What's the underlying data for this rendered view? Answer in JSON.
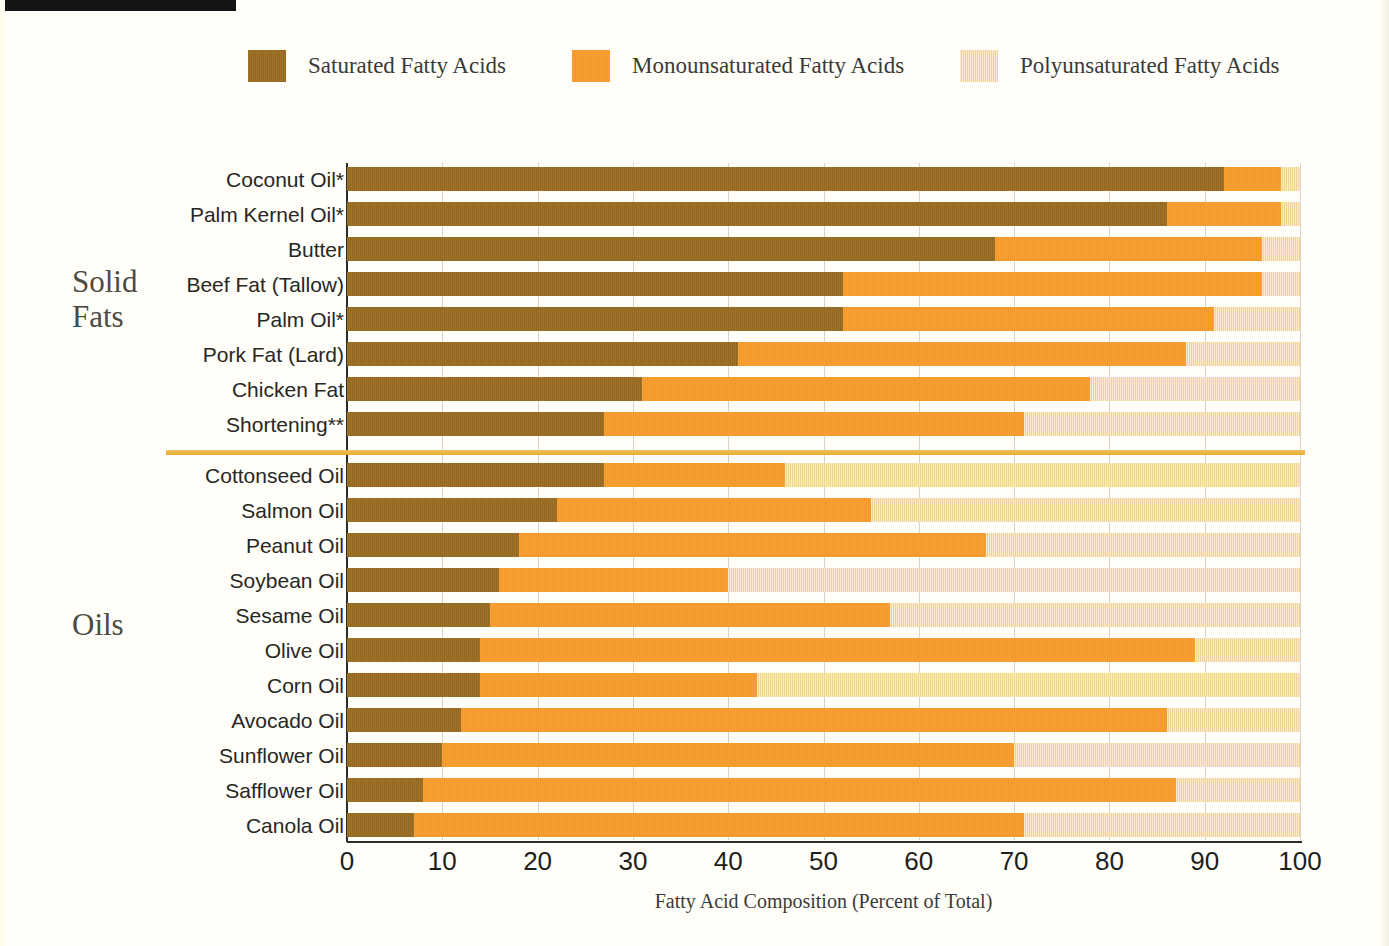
{
  "legend": {
    "items": [
      {
        "label": "Saturated Fatty Acids",
        "color": "#9A6B20",
        "icon": "legend-swatch-saturated"
      },
      {
        "label": "Monounsaturated Fatty Acids",
        "color": "#F89B2A",
        "icon": "legend-swatch-monounsaturated"
      },
      {
        "label": "Polyunsaturated Fatty Acids",
        "color": "#F9DCA8",
        "icon": "legend-swatch-polyunsaturated"
      }
    ]
  },
  "groups": {
    "solid_fats": "Solid\nFats",
    "solid_fats_line1": "Solid",
    "solid_fats_line2": "Fats",
    "oils": "Oils"
  },
  "chart_data": {
    "type": "bar",
    "orientation": "horizontal",
    "stacked": true,
    "title": "",
    "xlabel": "Fatty Acid Composition (Percent of Total)",
    "ylabel": "",
    "xlim": [
      0,
      100
    ],
    "xticks": [
      0,
      10,
      20,
      30,
      40,
      50,
      60,
      70,
      80,
      90,
      100
    ],
    "grid": true,
    "legend_position": "top",
    "categories": [
      "Coconut Oil*",
      "Palm Kernel Oil*",
      "Butter",
      "Beef Fat (Tallow)",
      "Palm Oil*",
      "Pork Fat (Lard)",
      "Chicken Fat",
      "Shortening**",
      "Cottonseed  Oil",
      "Salmon Oil",
      "Peanut Oil",
      "Soybean Oil",
      "Sesame Oil",
      "Olive Oil",
      "Corn Oil",
      "Avocado Oil",
      "Sunflower Oil",
      "Safflower Oil",
      "Canola Oil"
    ],
    "group_of_category": [
      "Solid Fats",
      "Solid Fats",
      "Solid Fats",
      "Solid Fats",
      "Solid Fats",
      "Solid Fats",
      "Solid Fats",
      "Solid Fats",
      "Oils",
      "Oils",
      "Oils",
      "Oils",
      "Oils",
      "Oils",
      "Oils",
      "Oils",
      "Oils",
      "Oils",
      "Oils"
    ],
    "series": [
      {
        "name": "Saturated Fatty Acids",
        "color": "#9A6B20",
        "values": [
          92,
          86,
          68,
          52,
          52,
          41,
          31,
          27,
          27,
          22,
          18,
          16,
          15,
          14,
          14,
          12,
          10,
          8,
          7
        ]
      },
      {
        "name": "Monounsaturated Fatty Acids",
        "color": "#F89B2A",
        "values": [
          6,
          12,
          28,
          44,
          39,
          47,
          47,
          44,
          19,
          33,
          49,
          24,
          42,
          75,
          29,
          74,
          60,
          79,
          64
        ]
      },
      {
        "name": "Polyunsaturated Fatty Acids",
        "color": "#F9DCA8",
        "values": [
          2,
          2,
          4,
          4,
          9,
          12,
          22,
          29,
          54,
          45,
          33,
          60,
          43,
          11,
          57,
          14,
          30,
          13,
          29
        ]
      }
    ],
    "cumulative_endpoints": {
      "saturated_end": [
        92,
        86,
        68,
        52,
        52,
        41,
        31,
        27,
        27,
        22,
        18,
        16,
        15,
        14,
        14,
        12,
        10,
        8,
        7
      ],
      "mono_end": [
        98,
        98,
        96,
        96,
        91,
        88,
        78,
        71,
        46,
        55,
        67,
        40,
        57,
        89,
        43,
        86,
        70,
        87,
        71
      ],
      "poly_end": [
        100,
        100,
        100,
        100,
        100,
        100,
        100,
        100,
        100,
        100,
        100,
        100,
        100,
        100,
        100,
        100,
        100,
        100,
        100
      ]
    }
  },
  "colors": {
    "saturated": "#9A6B20",
    "monounsaturated": "#F89B2A",
    "polyunsaturated": "#F9DCA8",
    "divider": "#E8A92F",
    "background": "#FFFEF8"
  }
}
